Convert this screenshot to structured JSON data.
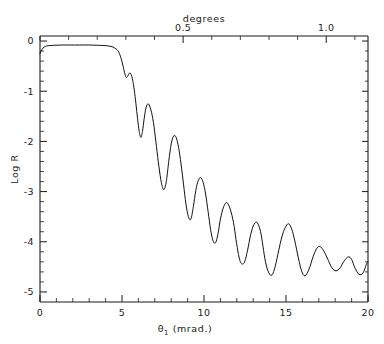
{
  "chart_data": {
    "type": "line",
    "title": "",
    "xlabel": "θ₁ (mrad.)",
    "ylabel": "Log R",
    "top_axis_label": "degrees",
    "xlim": [
      0,
      20
    ],
    "ylim": [
      -5.2,
      0.1
    ],
    "grid": false,
    "legend": null,
    "x_ticks": [
      0,
      5,
      10,
      15,
      20
    ],
    "x_ticklabels": [
      "0",
      "5",
      "10",
      "15",
      "20"
    ],
    "x_minor_step": 1,
    "y_ticks": [
      0,
      -1,
      -2,
      -3,
      -4,
      -5
    ],
    "y_ticklabels": [
      "0",
      "-1",
      "-2",
      "-3",
      "-4",
      "-5"
    ],
    "y_minor_step": 0.2,
    "top_ticks_deg": [
      0.5,
      1.0
    ],
    "top_ticklabels": [
      "0.5",
      "1.0"
    ],
    "top_minor_step_deg": 0.1,
    "mrad_per_degree": 17.4533,
    "series": [
      {
        "name": "Log R",
        "color": "#111111",
        "x": [
          0.0,
          0.12,
          0.25,
          0.4,
          0.6,
          0.9,
          1.3,
          1.8,
          2.4,
          3.0,
          3.5,
          3.9,
          4.2,
          4.45,
          4.65,
          4.8,
          4.95,
          5.05,
          5.15,
          5.25,
          5.35,
          5.45,
          5.55,
          5.65,
          5.75,
          5.85,
          5.95,
          6.05,
          6.15,
          6.25,
          6.35,
          6.45,
          6.55,
          6.65,
          6.8,
          6.95,
          7.1,
          7.25,
          7.4,
          7.55,
          7.7,
          7.85,
          8.0,
          8.15,
          8.3,
          8.45,
          8.6,
          8.75,
          8.9,
          9.05,
          9.2,
          9.35,
          9.5,
          9.65,
          9.8,
          9.95,
          10.1,
          10.25,
          10.4,
          10.55,
          10.7,
          10.85,
          11.0,
          11.2,
          11.4,
          11.6,
          11.8,
          11.95,
          12.1,
          12.25,
          12.45,
          12.65,
          12.85,
          13.05,
          13.25,
          13.45,
          13.6,
          13.75,
          13.95,
          14.15,
          14.35,
          14.55,
          14.75,
          14.95,
          15.15,
          15.35,
          15.55,
          15.75,
          15.95,
          16.15,
          16.4,
          16.65,
          16.9,
          17.1,
          17.3,
          17.55,
          17.8,
          18.05,
          18.3,
          18.55,
          18.8,
          19.0,
          19.2,
          19.45,
          19.7,
          19.9,
          20.0
        ],
        "y": [
          -0.25,
          -0.17,
          -0.12,
          -0.1,
          -0.09,
          -0.085,
          -0.08,
          -0.08,
          -0.08,
          -0.08,
          -0.085,
          -0.09,
          -0.1,
          -0.12,
          -0.16,
          -0.22,
          -0.35,
          -0.48,
          -0.62,
          -0.72,
          -0.7,
          -0.64,
          -0.66,
          -0.78,
          -0.98,
          -1.25,
          -1.55,
          -1.8,
          -1.92,
          -1.8,
          -1.55,
          -1.35,
          -1.26,
          -1.27,
          -1.42,
          -1.7,
          -2.1,
          -2.5,
          -2.82,
          -2.96,
          -2.8,
          -2.4,
          -2.05,
          -1.89,
          -1.92,
          -2.12,
          -2.45,
          -2.85,
          -3.25,
          -3.5,
          -3.55,
          -3.3,
          -2.98,
          -2.78,
          -2.72,
          -2.82,
          -3.05,
          -3.4,
          -3.75,
          -3.98,
          -4.02,
          -3.85,
          -3.55,
          -3.3,
          -3.22,
          -3.35,
          -3.62,
          -3.95,
          -4.25,
          -4.42,
          -4.42,
          -4.18,
          -3.85,
          -3.65,
          -3.62,
          -3.8,
          -4.1,
          -4.4,
          -4.62,
          -4.66,
          -4.48,
          -4.18,
          -3.9,
          -3.72,
          -3.64,
          -3.75,
          -4.0,
          -4.32,
          -4.58,
          -4.68,
          -4.55,
          -4.3,
          -4.12,
          -4.1,
          -4.18,
          -4.35,
          -4.52,
          -4.58,
          -4.52,
          -4.38,
          -4.3,
          -4.35,
          -4.52,
          -4.65,
          -4.62,
          -4.45,
          -4.4
        ]
      }
    ]
  },
  "axes": {
    "top_title": "degrees",
    "left_title": "Log R",
    "bottom_title_main": "θ",
    "bottom_title_sub": "1",
    "bottom_title_rest": " (mrad.)"
  }
}
